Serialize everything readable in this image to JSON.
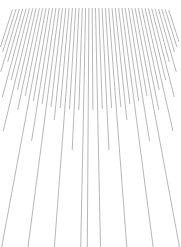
{
  "figure": {
    "type": "line-art",
    "background_color": "#ffffff",
    "line_color": "#8a8a8a",
    "line_width": 0.62,
    "canvas": {
      "width": 181,
      "height": 247
    }
  },
  "chart_data": {
    "type": "line",
    "xlabel": "",
    "ylabel": "",
    "grid": false,
    "legend": null,
    "xlim": [
      0,
      181
    ],
    "ylim": [
      0,
      247
    ],
    "vanishing_point": {
      "x": 90.5,
      "y": -232
    },
    "top_edge_y": 8,
    "top_span_x": [
      13,
      168
    ],
    "line_count": 47,
    "series": [
      {
        "name": "ray-00",
        "x_top": 13.0,
        "y_start": 9.6,
        "y_end": 47.0
      },
      {
        "name": "ray-01",
        "x_top": 16.3,
        "y_start": 9.2,
        "y_end": 52.0
      },
      {
        "name": "ray-02",
        "x_top": 19.6,
        "y_start": 8.9,
        "y_end": 72.0
      },
      {
        "name": "ray-03",
        "x_top": 22.9,
        "y_start": 8.7,
        "y_end": 62.0
      },
      {
        "name": "ray-04",
        "x_top": 26.2,
        "y_start": 8.5,
        "y_end": 97.0
      },
      {
        "name": "ray-05",
        "x_top": 29.5,
        "y_start": 8.4,
        "y_end": 80.0
      },
      {
        "name": "ray-06",
        "x_top": 32.8,
        "y_start": 8.3,
        "y_end": 131.0
      },
      {
        "name": "ray-07",
        "x_top": 36.1,
        "y_start": 8.2,
        "y_end": 90.0
      },
      {
        "name": "ray-08",
        "x_top": 39.4,
        "y_start": 8.1,
        "y_end": 110.0
      },
      {
        "name": "ray-09",
        "x_top": 42.7,
        "y_start": 8.1,
        "y_end": 96.0
      },
      {
        "name": "ray-10",
        "x_top": 46.0,
        "y_start": 8.0,
        "y_end": 247.0
      },
      {
        "name": "ray-11",
        "x_top": 49.3,
        "y_start": 8.0,
        "y_end": 101.0
      },
      {
        "name": "ray-12",
        "x_top": 52.6,
        "y_start": 8.0,
        "y_end": 141.0
      },
      {
        "name": "ray-13",
        "x_top": 55.9,
        "y_start": 8.0,
        "y_end": 104.0
      },
      {
        "name": "ray-14",
        "x_top": 59.2,
        "y_start": 8.0,
        "y_end": 247.0
      },
      {
        "name": "ray-15",
        "x_top": 62.5,
        "y_start": 8.0,
        "y_end": 107.0
      },
      {
        "name": "ray-16",
        "x_top": 65.8,
        "y_start": 8.0,
        "y_end": 120.0
      },
      {
        "name": "ray-17",
        "x_top": 69.1,
        "y_start": 8.0,
        "y_end": 108.0
      },
      {
        "name": "ray-18",
        "x_top": 72.4,
        "y_start": 8.0,
        "y_end": 247.0
      },
      {
        "name": "ray-19",
        "x_top": 75.7,
        "y_start": 8.0,
        "y_end": 109.0
      },
      {
        "name": "ray-20",
        "x_top": 79.0,
        "y_start": 8.0,
        "y_end": 150.0
      },
      {
        "name": "ray-21",
        "x_top": 82.3,
        "y_start": 8.0,
        "y_end": 110.0
      },
      {
        "name": "ray-22",
        "x_top": 85.6,
        "y_start": 8.0,
        "y_end": 247.0
      },
      {
        "name": "ray-23",
        "x_top": 88.9,
        "y_start": 8.0,
        "y_end": 247.0
      },
      {
        "name": "ray-24",
        "x_top": 92.2,
        "y_start": 8.0,
        "y_end": 110.0
      },
      {
        "name": "ray-25",
        "x_top": 95.5,
        "y_start": 8.0,
        "y_end": 247.0
      },
      {
        "name": "ray-26",
        "x_top": 98.8,
        "y_start": 8.0,
        "y_end": 109.0
      },
      {
        "name": "ray-27",
        "x_top": 102.1,
        "y_start": 8.0,
        "y_end": 150.0
      },
      {
        "name": "ray-28",
        "x_top": 105.4,
        "y_start": 8.0,
        "y_end": 108.0
      },
      {
        "name": "ray-29",
        "x_top": 108.7,
        "y_start": 8.0,
        "y_end": 247.0
      },
      {
        "name": "ray-30",
        "x_top": 112.0,
        "y_start": 8.0,
        "y_end": 107.0
      },
      {
        "name": "ray-31",
        "x_top": 115.3,
        "y_start": 8.0,
        "y_end": 120.0
      },
      {
        "name": "ray-32",
        "x_top": 118.6,
        "y_start": 8.0,
        "y_end": 104.0
      },
      {
        "name": "ray-33",
        "x_top": 121.9,
        "y_start": 8.0,
        "y_end": 247.0
      },
      {
        "name": "ray-34",
        "x_top": 125.2,
        "y_start": 8.0,
        "y_end": 101.0
      },
      {
        "name": "ray-35",
        "x_top": 128.5,
        "y_start": 8.0,
        "y_end": 141.0
      },
      {
        "name": "ray-36",
        "x_top": 131.8,
        "y_start": 8.0,
        "y_end": 96.0
      },
      {
        "name": "ray-37",
        "x_top": 135.1,
        "y_start": 8.1,
        "y_end": 247.0
      },
      {
        "name": "ray-38",
        "x_top": 138.4,
        "y_start": 8.1,
        "y_end": 110.0
      },
      {
        "name": "ray-39",
        "x_top": 141.7,
        "y_start": 8.2,
        "y_end": 90.0
      },
      {
        "name": "ray-40",
        "x_top": 145.0,
        "y_start": 8.3,
        "y_end": 131.0
      },
      {
        "name": "ray-41",
        "x_top": 148.3,
        "y_start": 8.4,
        "y_end": 80.0
      },
      {
        "name": "ray-42",
        "x_top": 151.6,
        "y_start": 8.5,
        "y_end": 97.0
      },
      {
        "name": "ray-43",
        "x_top": 154.9,
        "y_start": 8.7,
        "y_end": 62.0
      },
      {
        "name": "ray-44",
        "x_top": 158.2,
        "y_start": 8.9,
        "y_end": 72.0
      },
      {
        "name": "ray-45",
        "x_top": 161.5,
        "y_start": 9.2,
        "y_end": 52.0
      },
      {
        "name": "ray-46",
        "x_top": 164.8,
        "y_start": 9.6,
        "y_end": 47.0
      },
      {
        "name": "ray-47",
        "x_top": 168.1,
        "y_start": 10.0,
        "y_end": 42.0
      }
    ]
  }
}
